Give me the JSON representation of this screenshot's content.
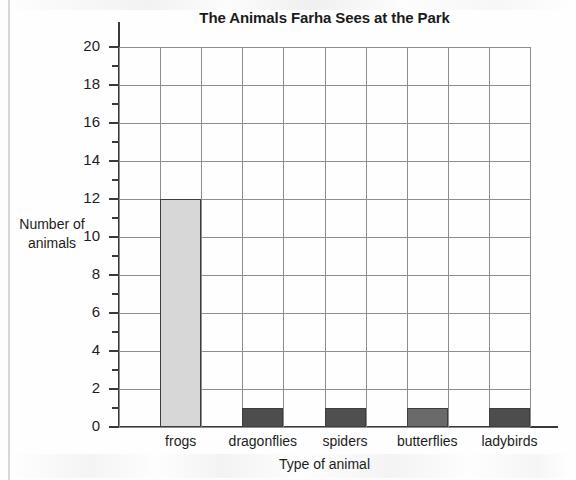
{
  "chart_data": {
    "type": "bar",
    "title": "The Animals Farha Sees at the Park",
    "xlabel": "Type of animal",
    "ylabel": "Number of animals",
    "ylabel_lines": [
      "Number of",
      "animals"
    ],
    "categories": [
      "frogs",
      "dragonflies",
      "spiders",
      "butterflies",
      "ladybirds"
    ],
    "values": [
      12,
      1,
      1,
      1,
      1
    ],
    "ylim": [
      0,
      20
    ],
    "y_major_step": 2,
    "y_minor_step": 1,
    "y_tick_labels": [
      "0",
      "2",
      "4",
      "6",
      "8",
      "10",
      "12",
      "14",
      "16",
      "18",
      "20"
    ],
    "y_tick_values": [
      0,
      2,
      4,
      6,
      8,
      10,
      12,
      14,
      16,
      18,
      20
    ],
    "grid": true,
    "grid_columns": 10,
    "legend": "none",
    "bar_colors": [
      "#d7d7d7",
      "#4d4d4d",
      "#4f4f4f",
      "#6a6a6a",
      "#4d4d4d"
    ],
    "bar_border_color": "#3d3d3d",
    "grid_color": "#8d8d8d",
    "axis_color": "#3a3a3a",
    "text_color": "#1d1d1d"
  }
}
